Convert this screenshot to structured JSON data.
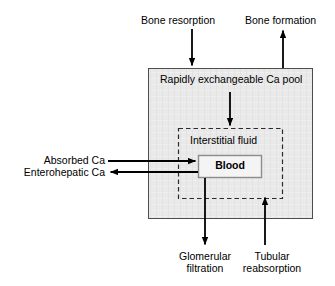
{
  "diagram": {
    "colors": {
      "pool_fill": "#e9e9e9",
      "pool_stroke": "#4d4d4d",
      "blood_fill": "#f2f2f2",
      "blood_stroke": "#8c8c8c",
      "dashed_stroke": "#2b2b2b",
      "arrow": "#000000",
      "text": "#000000",
      "background": "#ffffff"
    },
    "boxes": {
      "ca_pool": {
        "label": "Rapidly exchangeable Ca pool",
        "shape": "solid-rectangle",
        "x": 148,
        "y": 68,
        "width": 165,
        "height": 151
      },
      "interstitial_fluid": {
        "label": "Interstitial fluid",
        "shape": "dashed-rectangle",
        "x": 178,
        "y": 128,
        "width": 105,
        "height": 71
      },
      "blood": {
        "label": "Blood",
        "shape": "solid-rectangle",
        "x": 198,
        "y": 155,
        "width": 64,
        "height": 23
      }
    },
    "arrows": [
      {
        "name": "bone-resorption-arrow",
        "label": "Bone resorption",
        "direction": "down",
        "from": "external",
        "to": "ca_pool"
      },
      {
        "name": "bone-formation-arrow",
        "label": "Bone formation",
        "direction": "up",
        "from": "ca_pool",
        "to": "external"
      },
      {
        "name": "pool-to-interstitial-arrow",
        "label": "",
        "direction": "down",
        "from": "ca_pool",
        "to": "interstitial_fluid"
      },
      {
        "name": "absorbed-ca-arrow",
        "label": "Absorbed Ca",
        "direction": "right",
        "from": "external",
        "to": "blood"
      },
      {
        "name": "enterohepatic-ca-arrow",
        "label": "Enterohepatic Ca",
        "direction": "left",
        "from": "blood",
        "to": "external"
      },
      {
        "name": "glomerular-filtration-arrow",
        "label": "Glomerular filtration",
        "direction": "down",
        "from": "blood",
        "to": "external"
      },
      {
        "name": "tubular-reabsorption-arrow",
        "label": "Tubular reabsorption",
        "direction": "up",
        "from": "external",
        "to": "interstitial_fluid"
      }
    ],
    "labels": {
      "bone_resorption": "Bone resorption",
      "bone_formation": "Bone formation",
      "ca_pool": "Rapidly exchangeable Ca pool",
      "interstitial_fluid": "Interstitial fluid",
      "blood": "Blood",
      "absorbed_ca": "Absorbed Ca",
      "enterohepatic_ca": "Enterohepatic Ca",
      "glomerular_line1": "Glomerular",
      "glomerular_line2": "filtration",
      "tubular_line1": "Tubular",
      "tubular_line2": "reabsorption"
    }
  }
}
